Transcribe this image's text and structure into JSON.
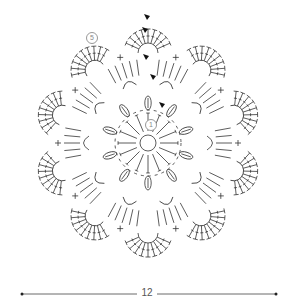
{
  "diagram": {
    "type": "crochet-motif-chart",
    "center": [
      148,
      143
    ],
    "stroke_color": "#333333",
    "marker_color": "#111111",
    "rounds": [
      {
        "round": 1,
        "label": "1",
        "kind": "sc-ring",
        "radius": 8,
        "stitches": 5
      },
      {
        "round": 2,
        "kind": "dc-spokes",
        "r_inner": 12,
        "r_outer": 30,
        "count": 16
      },
      {
        "round": 3,
        "kind": "puff-clusters",
        "radius": 40,
        "count": 10
      },
      {
        "round": 4,
        "kind": "chain-arches",
        "radius": 62,
        "count": 10
      },
      {
        "round": 5,
        "label": "5",
        "kind": "fan-scallops",
        "radius": 110,
        "count": 10,
        "stitches_per_fan": 9
      }
    ],
    "round_markers": [
      {
        "label": "1",
        "x": 150,
        "y": 124
      },
      {
        "label": "5",
        "x": 91,
        "y": 37
      }
    ],
    "start_markers": [
      {
        "x": 147,
        "y": 20
      },
      {
        "x": 145,
        "y": 33
      },
      {
        "x": 146,
        "y": 60
      },
      {
        "x": 153,
        "y": 80
      },
      {
        "x": 162,
        "y": 108
      }
    ]
  },
  "scale_bar": {
    "label": "12",
    "x1": 22,
    "x2": 276,
    "y": 294
  }
}
